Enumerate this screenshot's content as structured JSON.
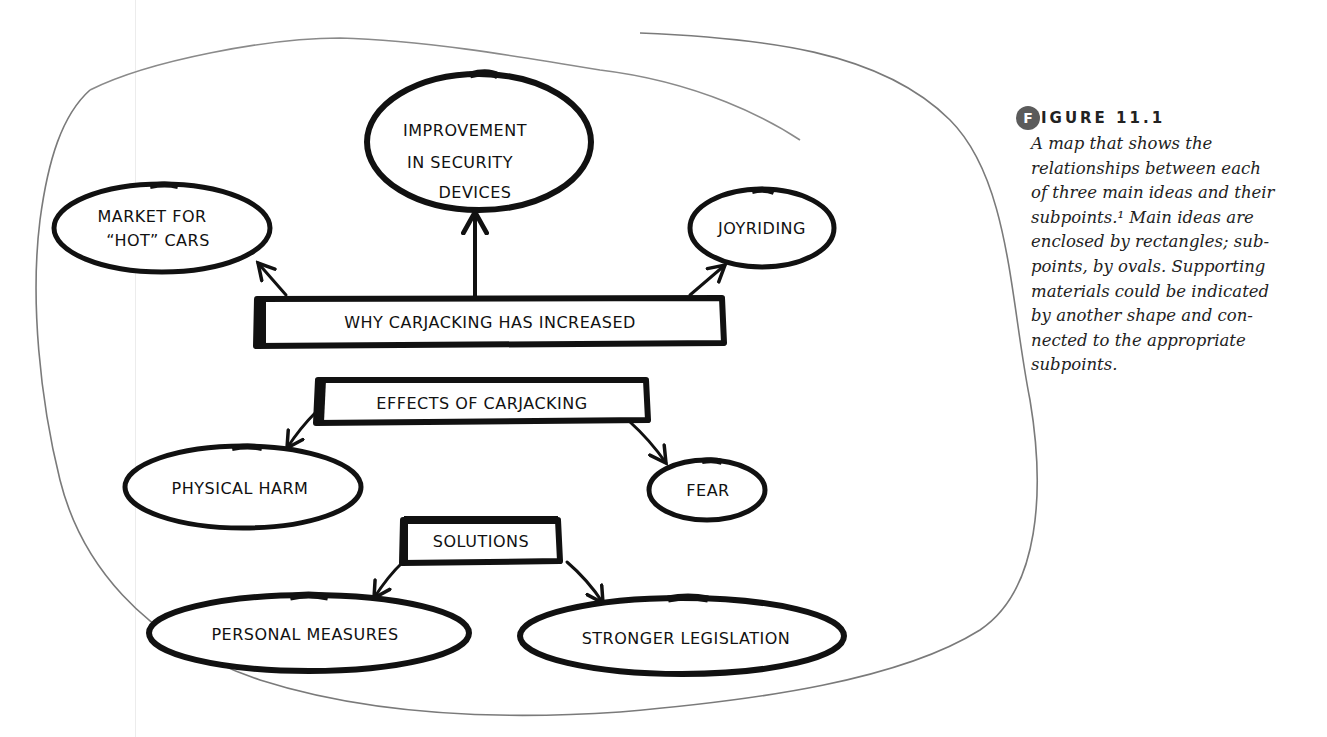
{
  "figure": {
    "badge_letter": "F",
    "label": "IGURE 11.1",
    "caption": "A map that shows the relationships between each of three main ideas and their subpoints.¹ Main ideas are enclosed by rectangles; subpoints, by ovals. Supporting materials could be indicated by another shape and connected to the appropriate subpoints.",
    "caption_lines": "A map that shows the\nrelationships between each\nof three main ideas and their\nsubpoints.¹ Main ideas are\nenclosed by rectangles; sub-\npoints, by ovals. Supporting\nmaterials could be indicated\nby another shape and con-\nnected to the appropriate\nsubpoints."
  },
  "diagram": {
    "main_ideas": [
      {
        "label": "WHY CARJACKING HAS INCREASED",
        "shape": "rectangle",
        "subpoints": [
          "MARKET FOR “HOT” CARS",
          "IMPROVEMENT IN SECURITY DEVICES",
          "JOYRIDING"
        ]
      },
      {
        "label": "EFFECTS OF CARJACKING",
        "shape": "rectangle",
        "subpoints": [
          "PHYSICAL HARM",
          "FEAR"
        ]
      },
      {
        "label": "SOLUTIONS",
        "shape": "rectangle",
        "subpoints": [
          "PERSONAL MEASURES",
          "STRONGER LEGISLATION"
        ]
      }
    ],
    "nodes": {
      "why": "WHY CARJACKING HAS INCREASED",
      "market_line1": "MARKET FOR",
      "market_line2": "“HOT” CARS",
      "improvement_line1": "IMPROVEMENT",
      "improvement_line2": "IN SECURITY",
      "improvement_line3": "DEVICES",
      "joyriding": "JOYRIDING",
      "effects": "EFFECTS OF CARJACKING",
      "physical_harm": "PHYSICAL HARM",
      "fear": "FEAR",
      "solutions": "SOLUTIONS",
      "personal_measures": "PERSONAL MEASURES",
      "stronger_legislation": "STRONGER LEGISLATION"
    },
    "colors": {
      "ink": "#111111",
      "outline": "#7a7a7a",
      "badge": "#5b5b5b"
    }
  }
}
